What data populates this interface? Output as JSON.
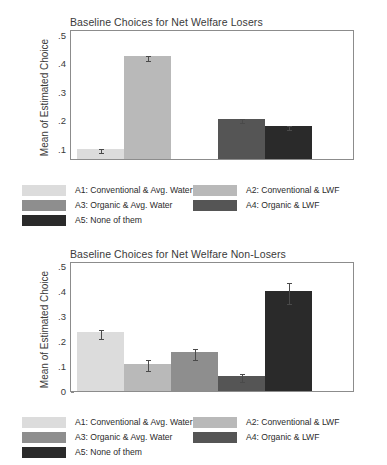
{
  "figure": {
    "background": "#ffffff",
    "axis_color": "#8c8c8c",
    "error_bar_color": "#4a4a4a"
  },
  "palette": {
    "A1": "#dcdcdc",
    "A2": "#b9b9b9",
    "A3": "#8e8e8e",
    "A4": "#555555",
    "A5": "#2a2a2a"
  },
  "legend": {
    "rows": [
      [
        {
          "key": "A1",
          "color": "#dcdcdc",
          "label": "A1: Conventional & Avg. Water"
        },
        {
          "key": "A2",
          "color": "#b9b9b9",
          "label": "A2: Conventional & LWF"
        }
      ],
      [
        {
          "key": "A3",
          "color": "#8e8e8e",
          "label": "A3: Organic & Avg. Water"
        },
        {
          "key": "A4",
          "color": "#555555",
          "label": "A4: Organic & LWF"
        }
      ],
      [
        {
          "key": "A5",
          "color": "#2a2a2a",
          "label": "A5: None of them"
        }
      ]
    ]
  },
  "chart_data": [
    {
      "id": "net-welfare-losers",
      "type": "bar",
      "title": "Baseline Choices for Net Welfare Losers",
      "xlabel": "",
      "ylabel": "Mean of Estimated Choice",
      "ylim": [
        0.065,
        0.52
      ],
      "yticks": [
        0.1,
        0.2,
        0.3,
        0.4,
        0.5
      ],
      "ytick_labels": [
        ".1",
        ".2",
        ".3",
        ".4",
        ".5"
      ],
      "grid": false,
      "legend_position": "below",
      "categories": [
        "A1",
        "A2",
        "A3",
        "A4",
        "A5"
      ],
      "category_labels": [
        "A1: Conventional & Avg. Water",
        "A2: Conventional & LWF",
        "A3: Organic & Avg. Water",
        "A4: Organic & LWF",
        "A5: None of them"
      ],
      "values": [
        0.1,
        0.425,
        0.003,
        0.205,
        0.18
      ],
      "errors": [
        0.006,
        0.009,
        0.002,
        0.008,
        0.008
      ],
      "colors": [
        "#dcdcdc",
        "#b9b9b9",
        "#8e8e8e",
        "#555555",
        "#2a2a2a"
      ]
    },
    {
      "id": "net-welfare-non-losers",
      "type": "bar",
      "title": "Baseline Choices for Net Welfare Non-Losers",
      "xlabel": "",
      "ylabel": "Mean of Estimated Choice",
      "ylim": [
        0,
        0.52
      ],
      "yticks": [
        0,
        0.1,
        0.2,
        0.3,
        0.4,
        0.5
      ],
      "ytick_labels": [
        "0",
        ".1",
        ".2",
        ".3",
        ".4",
        ".5"
      ],
      "grid": false,
      "legend_position": "below",
      "categories": [
        "A1",
        "A2",
        "A3",
        "A4",
        "A5"
      ],
      "category_labels": [
        "A1: Conventional & Avg. Water",
        "A2: Conventional & LWF",
        "A3: Organic & Avg. Water",
        "A4: Organic & LWF",
        "A5: None of them"
      ],
      "values": [
        0.235,
        0.11,
        0.155,
        0.06,
        0.4
      ],
      "errors": [
        0.018,
        0.022,
        0.022,
        0.016,
        0.042
      ],
      "colors": [
        "#dcdcdc",
        "#b9b9b9",
        "#8e8e8e",
        "#555555",
        "#2a2a2a"
      ]
    }
  ]
}
